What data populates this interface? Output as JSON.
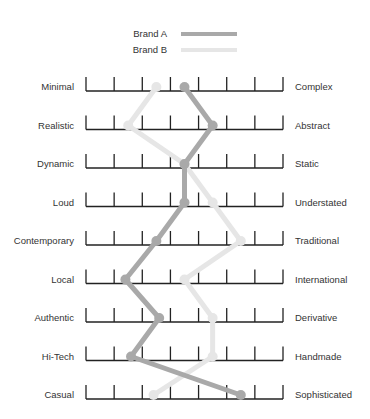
{
  "chart_data": {
    "type": "line",
    "title": "",
    "subtitle": "",
    "xlabel": "",
    "ylabel": "",
    "orientation": "semantic-differential (horizontal scales, one row per attribute pair)",
    "scale": {
      "min": 0,
      "max": 7,
      "ticks": [
        0,
        1,
        2,
        3,
        4,
        5,
        6,
        7
      ]
    },
    "grid": false,
    "legend": {
      "position": "top-center",
      "entries": [
        "Brand A",
        "Brand B"
      ]
    },
    "categories": [
      {
        "left": "Minimal",
        "right": "Complex"
      },
      {
        "left": "Realistic",
        "right": "Abstract"
      },
      {
        "left": "Dynamic",
        "right": "Static"
      },
      {
        "left": "Loud",
        "right": "Understated"
      },
      {
        "left": "Contemporary",
        "right": "Traditional"
      },
      {
        "left": "Local",
        "right": "International"
      },
      {
        "left": "Authentic",
        "right": "Derivative"
      },
      {
        "left": "Hi-Tech",
        "right": "Handmade"
      },
      {
        "left": "Casual",
        "right": "Sophisticated"
      }
    ],
    "series": [
      {
        "name": "Brand A",
        "color": "#a9a9a9",
        "values": [
          3.5,
          4.5,
          3.5,
          3.5,
          2.5,
          1.4,
          2.6,
          1.6,
          5.5
        ]
      },
      {
        "name": "Brand B",
        "color": "#e6e6e6",
        "values": [
          2.5,
          1.5,
          3.5,
          4.5,
          5.5,
          3.5,
          4.5,
          4.5,
          2.4
        ]
      }
    ]
  }
}
